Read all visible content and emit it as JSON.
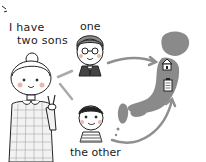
{
  "illustration": {
    "speech_line1": "I have",
    "speech_line2": "two sons",
    "label_one": "one",
    "label_other": "the other",
    "colors": {
      "map_fill": "#8a8a8a",
      "arrow": "#8f8f8f",
      "line": "#222222",
      "cheek": "#e8b8b0",
      "background": "#ffffff"
    },
    "figures": [
      {
        "name": "mother",
        "icon": "woman-peace-sign"
      },
      {
        "name": "son-one",
        "icon": "boy-with-glasses-suit"
      },
      {
        "name": "son-other",
        "icon": "boy-striped-shirt"
      }
    ],
    "map": {
      "icon": "japan-map",
      "markers": [
        "house-icon",
        "building-icon"
      ]
    }
  }
}
